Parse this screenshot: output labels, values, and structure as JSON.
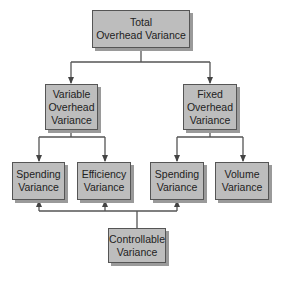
{
  "diagram": {
    "type": "hierarchy",
    "nodes": {
      "total": "Total\nOverhead Variance",
      "variable": "Variable\nOverhead\nVariance",
      "fixed": "Fixed\nOverhead\nVariance",
      "var_spending": "Spending\nVariance",
      "efficiency": "Efficiency\nVariance",
      "fixed_spending": "Spending\nVariance",
      "volume": "Volume\nVariance",
      "controllable": "Controllable\nVariance"
    },
    "edges": [
      [
        "total",
        "variable"
      ],
      [
        "total",
        "fixed"
      ],
      [
        "variable",
        "var_spending"
      ],
      [
        "variable",
        "efficiency"
      ],
      [
        "fixed",
        "fixed_spending"
      ],
      [
        "fixed",
        "volume"
      ],
      [
        "controllable",
        "var_spending"
      ],
      [
        "controllable",
        "efficiency"
      ],
      [
        "controllable",
        "fixed_spending"
      ]
    ],
    "colors": {
      "box_fill": "#bdbdbd",
      "box_border": "#555555",
      "shadow": "#9a9a9a",
      "line": "#555555"
    }
  }
}
